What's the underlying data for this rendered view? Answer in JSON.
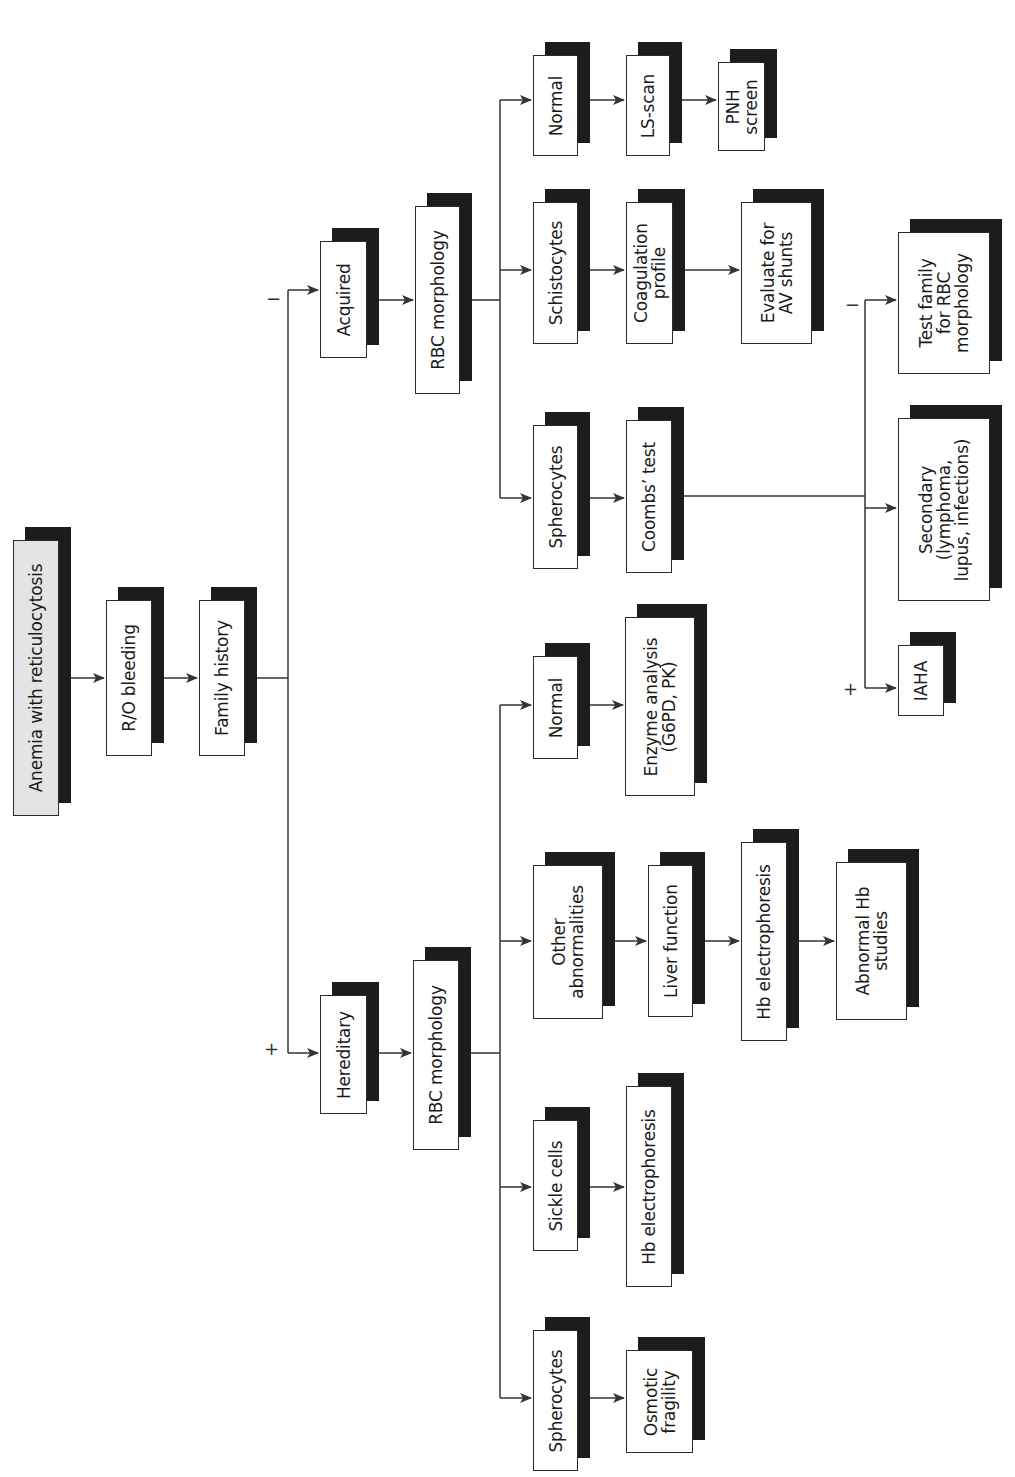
{
  "diagram": {
    "orientation": "rotated 90° counter-clockwise (text reads bottom-to-top)",
    "nodes": {
      "root": "Anemia with reticulocytosis",
      "ro_bleeding": "R/O bleeding",
      "family_history": "Family history",
      "acquired": "Acquired",
      "hereditary": "Hereditary",
      "rbc_morph_acquired": "RBC morphology",
      "rbc_morph_hereditary": "RBC morphology",
      "acq_normal": "Normal",
      "ls_scan": "LS-scan",
      "pnh_screen": "PNH\nscreen",
      "schistocytes": "Schistocytes",
      "coagulation_profile": "Coagulation\nprofile",
      "evaluate_av_shunts": "Evaluate for\nAV shunts",
      "acq_spherocytes": "Spherocytes",
      "coombs_test": "Coombs’ test",
      "test_family": "Test family\nfor RBC\nmorphology",
      "secondary": "Secondary\n(lymphoma,\nlupus, infections)",
      "iaha": "IAHA",
      "her_normal": "Normal",
      "enzyme_analysis": "Enzyme analysis\n(G6PD, PK)",
      "other_abnormalities": "Other\nabnormalities",
      "liver_function": "Liver function",
      "hb_electro_mid": "Hb electrophoresis",
      "abnormal_hb_studies": "Abnormal Hb\nstudies",
      "sickle_cells": "Sickle cells",
      "hb_electro_bottom": "Hb electrophoresis",
      "her_spherocytes": "Spherocytes",
      "osmotic_fragility": "Osmotic\nfragility"
    },
    "signs": {
      "family_minus": "−",
      "family_plus": "+",
      "coombs_minus": "−",
      "coombs_plus": "+"
    },
    "edges": [
      [
        "root",
        "ro_bleeding"
      ],
      [
        "ro_bleeding",
        "family_history"
      ],
      [
        "family_history",
        "acquired",
        "−"
      ],
      [
        "family_history",
        "hereditary",
        "+"
      ],
      [
        "acquired",
        "rbc_morph_acquired"
      ],
      [
        "rbc_morph_acquired",
        "acq_normal"
      ],
      [
        "rbc_morph_acquired",
        "schistocytes"
      ],
      [
        "rbc_morph_acquired",
        "acq_spherocytes"
      ],
      [
        "acq_normal",
        "ls_scan"
      ],
      [
        "ls_scan",
        "pnh_screen"
      ],
      [
        "schistocytes",
        "coagulation_profile"
      ],
      [
        "coagulation_profile",
        "evaluate_av_shunts"
      ],
      [
        "acq_spherocytes",
        "coombs_test"
      ],
      [
        "coombs_test",
        "test_family",
        "−"
      ],
      [
        "coombs_test",
        "secondary"
      ],
      [
        "coombs_test",
        "iaha",
        "+"
      ],
      [
        "hereditary",
        "rbc_morph_hereditary"
      ],
      [
        "rbc_morph_hereditary",
        "her_normal"
      ],
      [
        "rbc_morph_hereditary",
        "other_abnormalities"
      ],
      [
        "rbc_morph_hereditary",
        "sickle_cells"
      ],
      [
        "rbc_morph_hereditary",
        "her_spherocytes"
      ],
      [
        "her_normal",
        "enzyme_analysis"
      ],
      [
        "other_abnormalities",
        "liver_function"
      ],
      [
        "liver_function",
        "hb_electro_mid"
      ],
      [
        "hb_electro_mid",
        "abnormal_hb_studies"
      ],
      [
        "sickle_cells",
        "hb_electro_bottom"
      ],
      [
        "her_spherocytes",
        "osmotic_fragility"
      ]
    ]
  },
  "colors": {
    "root_fill": "#e4e4e4",
    "shadow": "#1c1c1c",
    "line": "#333333"
  }
}
